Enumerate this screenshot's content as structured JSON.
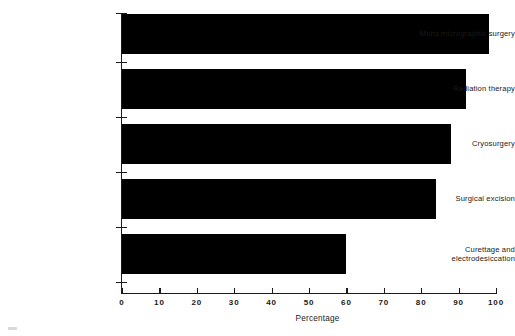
{
  "chart_data": {
    "type": "bar",
    "orientation": "horizontal",
    "title": "",
    "subtitle": "",
    "xlabel": "Percentage",
    "ylabel": "",
    "xlim": [
      0,
      100
    ],
    "xticks": [
      "0",
      "10",
      "20",
      "30",
      "40",
      "50",
      "60",
      "70",
      "80",
      "90",
      "100"
    ],
    "xtick_values": [
      0,
      10,
      20,
      30,
      40,
      50,
      60,
      70,
      80,
      90,
      100
    ],
    "grid": false,
    "legend": false,
    "bar_color": "#000000",
    "axis_color": "#1a1a1a",
    "background": "#ffffff",
    "categories": [
      "Mohs micrographic surgery",
      "Radiation therapy",
      "Cryosurgery",
      "Surgical  excision",
      "Curettage and\nelectrodesiccation"
    ],
    "values": [
      98,
      92,
      88,
      84,
      60
    ],
    "series": [
      {
        "name": "Percentage",
        "values": [
          98,
          92,
          88,
          84,
          60
        ]
      }
    ],
    "bars": [
      {
        "label": "Mohs micrographic surgery",
        "value": 98
      },
      {
        "label": "Radiation therapy",
        "value": 92
      },
      {
        "label": "Cryosurgery",
        "value": 88
      },
      {
        "label": "Surgical  excision",
        "value": 84
      },
      {
        "label": "Curettage and\nelectrodesiccation",
        "value": 60
      }
    ]
  }
}
